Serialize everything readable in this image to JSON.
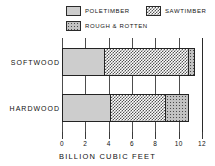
{
  "chart_data": {
    "type": "bar",
    "orientation": "horizontal",
    "stacked": true,
    "title": "",
    "xlabel": "BILLION CUBIC FEET",
    "ylabel": "",
    "xlim": [
      0,
      12
    ],
    "xticks": [
      0,
      2,
      4,
      6,
      8,
      10,
      12
    ],
    "xtick_labels": [
      "0",
      "2",
      "4",
      "6",
      "8",
      "10",
      "12"
    ],
    "grid": true,
    "grid_axis": "x",
    "legend_position": "top",
    "categories": [
      "SOFTWOOD",
      "HARDWOOD"
    ],
    "series": [
      {
        "name": "POLETIMBER",
        "values": [
          3.7,
          4.2
        ]
      },
      {
        "name": "SAWTIMBER",
        "values": [
          7.2,
          4.7
        ]
      },
      {
        "name": "ROUGH & ROTTEN",
        "values": [
          0.5,
          2.0
        ]
      }
    ],
    "segment_totals": [
      11.4,
      10.9
    ]
  },
  "legend": {
    "items": [
      {
        "label": "POLETIMBER",
        "swatch": "stipple-pattern-swatch"
      },
      {
        "label": "SAWTIMBER",
        "swatch": "checkerboard-pattern-swatch"
      },
      {
        "label": "ROUGH & ROTTEN",
        "swatch": "coarse-stipple-pattern-swatch"
      }
    ]
  },
  "axis": {
    "title": "BILLION CUBIC FEET",
    "tick_labels": [
      "0",
      "2",
      "4",
      "6",
      "8",
      "10",
      "12"
    ]
  },
  "categories": {
    "softwood": "SOFTWOOD",
    "hardwood": "HARDWOOD"
  },
  "colors": {
    "ink": "#111111",
    "gridline": "#4d4d4d",
    "poletimber_fill": "#cdcdcd",
    "sawtimber_fill": "#ffffff",
    "rough_fill": "#c2c2c2"
  }
}
